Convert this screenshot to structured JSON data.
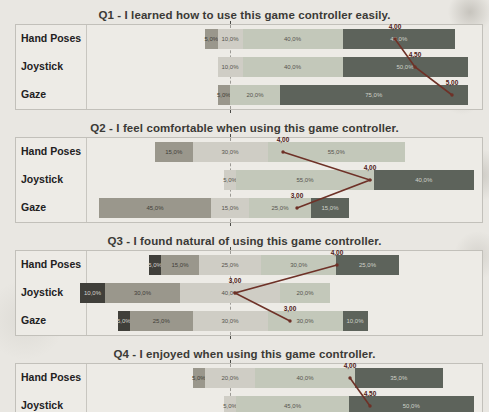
{
  "page": {
    "background": "#e9e7e2"
  },
  "likert": {
    "category_order": [
      "strongly_disagree",
      "disagree",
      "neutral",
      "agree",
      "strongly_agree"
    ],
    "colors": {
      "strongly_disagree": "#403f3a",
      "disagree": "#9a978c",
      "neutral": "#cfcdc5",
      "agree": "#c3c8ba",
      "strongly_agree": "#5d635b"
    },
    "label_colors": {
      "strongly_disagree": "#d6d4cd",
      "disagree": "#3f3e39",
      "neutral": "#55544e",
      "agree": "#55544e",
      "strongly_agree": "#cfd2ca"
    },
    "median_line_color": "#6e3127",
    "center_axis_x_px": 230,
    "px_per_percent": 2.5
  },
  "chart_data": [
    {
      "type": "bar",
      "variant": "diverging-stacked-likert",
      "title": "Q1 - I learned how to use this game controller easily.",
      "categories": [
        "Hand Poses",
        "Joystick",
        "Gaze"
      ],
      "rows": [
        {
          "label": "Hand Poses",
          "median_label": "4,00",
          "marker_x_px": 395,
          "segments": [
            {
              "category": "disagree",
              "pct": 5,
              "label": "5,0%"
            },
            {
              "category": "neutral",
              "pct": 10,
              "label": "10,0%"
            },
            {
              "category": "agree",
              "pct": 40,
              "label": "40,0%"
            },
            {
              "category": "strongly_agree",
              "pct": 45,
              "label": "45,0%"
            }
          ]
        },
        {
          "label": "Joystick",
          "median_label": "4,50",
          "marker_x_px": 415,
          "segments": [
            {
              "category": "neutral",
              "pct": 10,
              "label": "10,0%"
            },
            {
              "category": "agree",
              "pct": 40,
              "label": "40,0%"
            },
            {
              "category": "strongly_agree",
              "pct": 50,
              "label": "50,0%"
            }
          ]
        },
        {
          "label": "Gaze",
          "median_label": "5,00",
          "marker_x_px": 452,
          "segments": [
            {
              "category": "disagree",
              "pct": 5,
              "label": "5,0%"
            },
            {
              "category": "agree",
              "pct": 20,
              "label": "20,0%"
            },
            {
              "category": "strongly_agree",
              "pct": 75,
              "label": "75,0%"
            }
          ]
        }
      ]
    },
    {
      "type": "bar",
      "variant": "diverging-stacked-likert",
      "title": "Q2 - I feel comfortable when using this game controller.",
      "categories": [
        "Hand Poses",
        "Joystick",
        "Gaze"
      ],
      "rows": [
        {
          "label": "Hand Poses",
          "median_label": "4,00",
          "marker_x_px": 283,
          "segments": [
            {
              "category": "disagree",
              "pct": 15,
              "label": "15,0%"
            },
            {
              "category": "neutral",
              "pct": 30,
              "label": "30,0%"
            },
            {
              "category": "agree",
              "pct": 55,
              "label": "55,0%"
            }
          ]
        },
        {
          "label": "Joystick",
          "median_label": "4,00",
          "marker_x_px": 370,
          "segments": [
            {
              "category": "neutral",
              "pct": 5,
              "label": "5,0%"
            },
            {
              "category": "agree",
              "pct": 55,
              "label": "55,0%"
            },
            {
              "category": "strongly_agree",
              "pct": 40,
              "label": "40,0%"
            }
          ]
        },
        {
          "label": "Gaze",
          "median_label": "3,00",
          "marker_x_px": 297,
          "segments": [
            {
              "category": "disagree",
              "pct": 45,
              "label": "45,0%"
            },
            {
              "category": "neutral",
              "pct": 15,
              "label": "15,0%"
            },
            {
              "category": "agree",
              "pct": 25,
              "label": "25,0%"
            },
            {
              "category": "strongly_agree",
              "pct": 15,
              "label": "15,0%"
            }
          ]
        }
      ]
    },
    {
      "type": "bar",
      "variant": "diverging-stacked-likert",
      "title": "Q3 - I found natural of using this game controller.",
      "categories": [
        "Hand Poses",
        "Joystick",
        "Gaze"
      ],
      "rows": [
        {
          "label": "Hand Poses",
          "median_label": "4,00",
          "marker_x_px": 337,
          "segments": [
            {
              "category": "strongly_disagree",
              "pct": 5,
              "label": "5,0%"
            },
            {
              "category": "disagree",
              "pct": 15,
              "label": "15,0%"
            },
            {
              "category": "neutral",
              "pct": 25,
              "label": "25,0%"
            },
            {
              "category": "agree",
              "pct": 30,
              "label": "30,0%"
            },
            {
              "category": "strongly_agree",
              "pct": 25,
              "label": "25,0%"
            }
          ]
        },
        {
          "label": "Joystick",
          "median_label": "3,00",
          "marker_x_px": 235,
          "segments": [
            {
              "category": "strongly_disagree",
              "pct": 10,
              "label": "10,0%"
            },
            {
              "category": "disagree",
              "pct": 30,
              "label": "30,0%"
            },
            {
              "category": "neutral",
              "pct": 40,
              "label": "40,0%"
            },
            {
              "category": "agree",
              "pct": 20,
              "label": "20,0%"
            }
          ]
        },
        {
          "label": "Gaze",
          "median_label": "3,00",
          "marker_x_px": 290,
          "segments": [
            {
              "category": "strongly_disagree",
              "pct": 5,
              "label": "5,0%"
            },
            {
              "category": "disagree",
              "pct": 25,
              "label": "25,0%"
            },
            {
              "category": "neutral",
              "pct": 30,
              "label": "30,0%"
            },
            {
              "category": "agree",
              "pct": 30,
              "label": "30,0%"
            },
            {
              "category": "strongly_agree",
              "pct": 10,
              "label": "10,0%"
            }
          ]
        }
      ]
    },
    {
      "type": "bar",
      "variant": "diverging-stacked-likert",
      "title": "Q4 - I enjoyed when using this game controller.",
      "categories": [
        "Hand Poses",
        "Joystick"
      ],
      "rows": [
        {
          "label": "Hand Poses",
          "median_label": "4,00",
          "marker_x_px": 350,
          "segments": [
            {
              "category": "disagree",
              "pct": 5,
              "label": "5,0%"
            },
            {
              "category": "neutral",
              "pct": 20,
              "label": "20,0%"
            },
            {
              "category": "agree",
              "pct": 40,
              "label": "40,0%"
            },
            {
              "category": "strongly_agree",
              "pct": 35,
              "label": "35,0%"
            }
          ]
        },
        {
          "label": "Joystick",
          "median_label": "4,50",
          "marker_x_px": 370,
          "segments": [
            {
              "category": "neutral",
              "pct": 5,
              "label": "5,0%"
            },
            {
              "category": "agree",
              "pct": 45,
              "label": "45,0%"
            },
            {
              "category": "strongly_agree",
              "pct": 50,
              "label": "50,0%"
            }
          ]
        }
      ]
    }
  ]
}
